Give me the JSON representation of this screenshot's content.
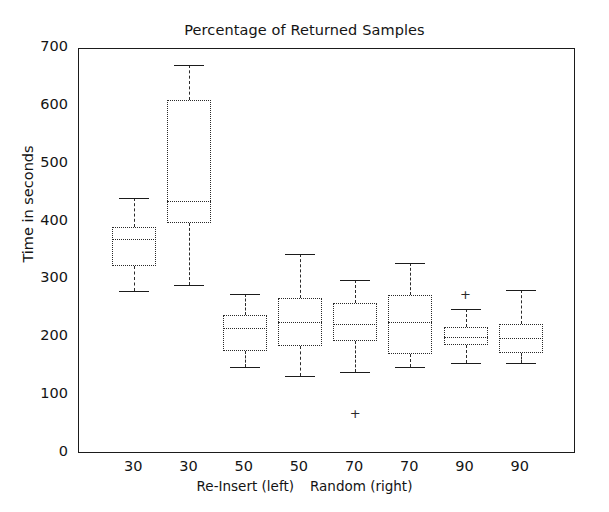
{
  "chart_data": {
    "type": "box",
    "title": "Percentage of Returned Samples",
    "xlabel": "Re-Insert (left)  Random (right)",
    "ylabel": "Time in seconds",
    "ylim": [
      0,
      700
    ],
    "yticks": [
      0,
      100,
      200,
      300,
      400,
      500,
      600,
      700
    ],
    "ytick_labels": [
      "0",
      "100",
      "200",
      "300",
      "400",
      "500",
      "600",
      "700"
    ],
    "grid": false,
    "legend": null,
    "categories": [
      "30",
      "30",
      "50",
      "50",
      "70",
      "70",
      "90",
      "90"
    ],
    "group_caption_left": "Re-Insert (left)",
    "group_caption_right": "Random (right)",
    "boxes": [
      {
        "label": "30",
        "group": "Re-Insert",
        "whisker_low": 282,
        "q1": 325,
        "median": 371,
        "q3": 392,
        "whisker_high": 442,
        "fliers": []
      },
      {
        "label": "30",
        "group": "Random",
        "whisker_low": 292,
        "q1": 399,
        "median": 437,
        "q3": 612,
        "whisker_high": 673,
        "fliers": []
      },
      {
        "label": "50",
        "group": "Re-Insert",
        "whisker_low": 150,
        "q1": 178,
        "median": 218,
        "q3": 240,
        "whisker_high": 276,
        "fliers": []
      },
      {
        "label": "50",
        "group": "Random",
        "whisker_low": 134,
        "q1": 187,
        "median": 228,
        "q3": 270,
        "whisker_high": 345,
        "fliers": []
      },
      {
        "label": "70",
        "group": "Re-Insert",
        "whisker_low": 142,
        "q1": 195,
        "median": 224,
        "q3": 261,
        "whisker_high": 300,
        "fliers": [
          69
        ]
      },
      {
        "label": "70",
        "group": "Random",
        "whisker_low": 150,
        "q1": 172,
        "median": 229,
        "q3": 274,
        "whisker_high": 330,
        "fliers": []
      },
      {
        "label": "90",
        "group": "Re-Insert",
        "whisker_low": 158,
        "q1": 188,
        "median": 203,
        "q3": 219,
        "whisker_high": 250,
        "fliers": [
          275
        ]
      },
      {
        "label": "90",
        "group": "Random",
        "whisker_low": 157,
        "q1": 175,
        "median": 201,
        "q3": 224,
        "whisker_high": 283,
        "fliers": []
      }
    ],
    "colors": {
      "axis": "#1b1b1b",
      "box_edge": "#2a2a2a",
      "median": "#2a2a2a",
      "whisker": "#2a2a2a",
      "cap": "#1b1b1b",
      "flier": "#2a2a2a",
      "background": "#ffffff"
    },
    "flier_marker": "+"
  }
}
